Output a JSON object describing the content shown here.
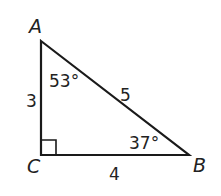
{
  "diagram": {
    "type": "right-triangle",
    "vertices": {
      "A": {
        "label": "A",
        "x": 41,
        "y": 41
      },
      "B": {
        "label": "B",
        "x": 189,
        "y": 155
      },
      "C": {
        "label": "C",
        "x": 41,
        "y": 155
      }
    },
    "sides": {
      "AC": "3",
      "CB": "4",
      "AB": "5"
    },
    "angles": {
      "A": "53°",
      "B": "37°",
      "C": "right-angle"
    },
    "stroke_color": "#1a1a1a"
  }
}
